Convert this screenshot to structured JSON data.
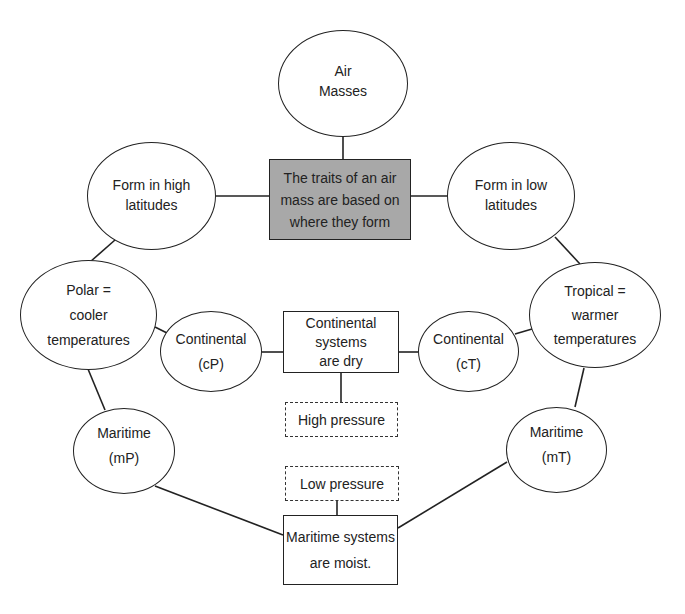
{
  "diagram": {
    "title_cutoff": "",
    "nodes": {
      "air_masses": {
        "lines": [
          "Air",
          "Masses"
        ]
      },
      "central": {
        "lines": [
          "The traits of an air",
          "mass are based on",
          "where they form"
        ],
        "fill": "#a8a8a8"
      },
      "high_lat": {
        "lines": [
          "Form in high",
          "latitudes"
        ]
      },
      "low_lat": {
        "lines": [
          "Form in low",
          "latitudes"
        ]
      },
      "polar": {
        "lines": [
          "Polar =",
          "cooler",
          "temperatures"
        ]
      },
      "tropical": {
        "lines": [
          "Tropical =",
          "warmer",
          "temperatures"
        ]
      },
      "cont_cp": {
        "lines": [
          "Continental",
          "(cP)"
        ]
      },
      "cont_ct": {
        "lines": [
          "Continental",
          "(cT)"
        ]
      },
      "cont_systems": {
        "lines": [
          "Continental",
          "systems",
          "are dry"
        ]
      },
      "high_pressure": {
        "lines": [
          "High pressure"
        ]
      },
      "low_pressure": {
        "lines": [
          "Low pressure"
        ]
      },
      "maritime_mp": {
        "lines": [
          "Maritime",
          "(mP)"
        ]
      },
      "maritime_mt": {
        "lines": [
          "Maritime",
          "(mT)"
        ]
      },
      "maritime_systems": {
        "lines": [
          "Maritime systems",
          "are moist."
        ]
      }
    }
  }
}
